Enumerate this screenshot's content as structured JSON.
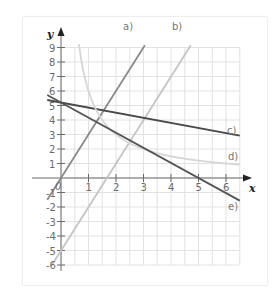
{
  "chart_data": {
    "type": "line",
    "title": "",
    "xlabel": "x",
    "ylabel": "y",
    "xlim": [
      -0.5,
      6.5
    ],
    "ylim": [
      -6,
      9
    ],
    "grid": true,
    "x_ticks": [
      "0",
      "1",
      "2",
      "3",
      "4",
      "5",
      "6"
    ],
    "y_ticks": [
      "9",
      "8",
      "7",
      "6",
      "5",
      "4",
      "3",
      "2",
      "1",
      "-1",
      "-2",
      "-3",
      "-4",
      "-5",
      "-6"
    ],
    "origin_label": "0",
    "series": [
      {
        "name": "a)",
        "equation": "y = 3x",
        "color": "#8a8a8a",
        "x": [
          -0.5,
          3.05
        ],
        "y": [
          -1.5,
          9.15
        ]
      },
      {
        "name": "b)",
        "equation": "y = 3x - 5",
        "color": "#c4c4c4",
        "x": [
          -0.33,
          4.72
        ],
        "y": [
          -6,
          9.15
        ]
      },
      {
        "name": "c)",
        "equation": "y = 5.2 - 0.35x",
        "color": "#4a4a4a",
        "x": [
          -0.5,
          6.5
        ],
        "y": [
          5.38,
          2.93
        ]
      },
      {
        "name": "d)",
        "equation": "y = 6/x",
        "color": "#d6d6d6",
        "x": [
          0.65,
          6.5
        ],
        "y": [
          9.2,
          0.92
        ]
      },
      {
        "name": "e)",
        "equation": "y = -1.04x + 5.2",
        "color": "#555555",
        "x": [
          -0.5,
          6.5
        ],
        "y": [
          5.72,
          -1.56
        ]
      }
    ]
  },
  "labels": {
    "x_axis": "x",
    "y_axis": "y",
    "origin": "0",
    "a": "a)",
    "b": "b)",
    "c": "c)",
    "d": "d)",
    "e": "e)"
  }
}
